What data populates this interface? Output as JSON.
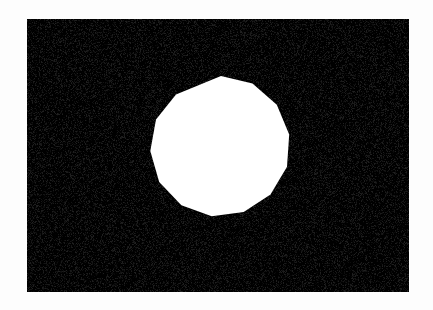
{
  "image": {
    "width": 433,
    "height": 310,
    "page_background_color": "#fdfdfd",
    "title": "White regular polygon on black field"
  },
  "black_field": {
    "name": "black-field",
    "fill_color": "#000000",
    "x": 27,
    "y": 19,
    "width": 382,
    "height": 273,
    "grain": {
      "enabled": true,
      "description": "film-grain speckle noise",
      "light_speck_color": "#3a3a3a",
      "dark_speck_color": "#000000",
      "opacity": 0.55,
      "density": 2600
    }
  },
  "shape": {
    "name": "regular-polygon",
    "type": "polygon",
    "sides": 13,
    "fill_color": "#ffffff",
    "center_x": 221,
    "center_y": 148,
    "radius": 72,
    "rotation_degrees": -90,
    "vertices": [
      [
        221.0,
        76.0
      ],
      [
        252.5,
        83.5
      ],
      [
        276.8,
        104.8
      ],
      [
        289.2,
        134.6
      ],
      [
        287.0,
        166.8
      ],
      [
        270.5,
        194.6
      ],
      [
        243.7,
        212.1
      ],
      [
        211.7,
        216.3
      ],
      [
        181.4,
        205.3
      ],
      [
        159.2,
        182.0
      ],
      [
        150.3,
        151.0
      ],
      [
        156.0,
        119.5
      ],
      [
        176.0,
        94.6
      ]
    ]
  }
}
